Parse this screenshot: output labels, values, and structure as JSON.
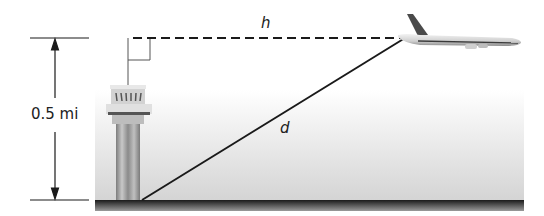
{
  "diagram": {
    "type": "right-triangle word problem illustration",
    "labels": {
      "height": "0.5 mi",
      "horizontal": "h",
      "hypotenuse": "d"
    },
    "objects": [
      "control-tower",
      "airplane",
      "ground"
    ],
    "colors": {
      "line": "#1a1a1a",
      "ground": "#2a2a2a",
      "sky_gradient_bottom": "#d9d9d9",
      "tower": "#9a9a9a"
    }
  }
}
